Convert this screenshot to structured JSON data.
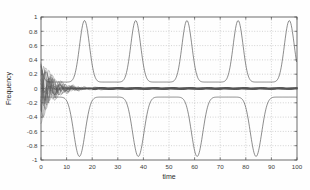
{
  "chart_data": {
    "type": "line",
    "title": "",
    "xlabel": "time",
    "ylabel": "Frequency",
    "xlim": [
      0,
      100
    ],
    "ylim": [
      -1,
      1
    ],
    "grid": true,
    "legend": "none",
    "x_ticks": [
      0,
      10,
      20,
      30,
      40,
      50,
      60,
      70,
      80,
      90,
      100
    ],
    "x_tick_labels": [
      "0",
      "10",
      "20",
      "30",
      "40",
      "50",
      "60",
      "70",
      "80",
      "90",
      "100"
    ],
    "y_ticks": [
      -1,
      -0.8,
      -0.6,
      -0.4,
      -0.2,
      0,
      0.2,
      0.4,
      0.6,
      0.8,
      1
    ],
    "y_tick_labels": [
      "-1",
      "-0.8",
      "-0.6",
      "-0.4",
      "-0.2",
      "0",
      "0.2",
      "0.4",
      "0.6",
      "0.8",
      "1"
    ],
    "series": [
      {
        "name": "upper-envelope-oscillation",
        "description": "Sharp periodic positive peaks reaching about 0.95 with flat valleys near 0.09",
        "period": 20.0,
        "peak_value": 0.95,
        "valley_value": 0.09,
        "peak_times": [
          17,
          37,
          57,
          77,
          97
        ],
        "valley_times": [
          27,
          47,
          67,
          87
        ]
      },
      {
        "name": "lower-envelope-oscillation",
        "description": "Sharp periodic negative troughs reaching about -0.95 with flat plateaus near -0.12",
        "period": 23.0,
        "trough_value": -0.95,
        "plateau_value": -0.12,
        "trough_times": [
          15,
          38,
          61,
          84
        ],
        "plateau_times": [
          26,
          49,
          72,
          95
        ]
      },
      {
        "name": "damped-transient-bundle",
        "description": "Dense bundle of many damped oscillating traces starting between -0.7 and 0.67 at t=0 and converging to 0 by about t=20",
        "count": 24,
        "initial_range": [
          -0.7,
          0.67
        ],
        "settling_time": 20,
        "settled_value": 0.0
      }
    ],
    "colors": {
      "line": "#4f4f4f",
      "grid": "#a8a8a8",
      "axis": "#4a4a4a",
      "background": "#fefefe"
    }
  }
}
